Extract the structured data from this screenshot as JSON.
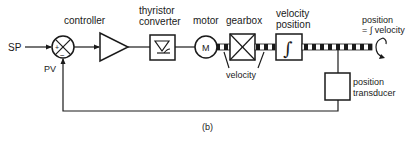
{
  "diagram": {
    "caption": "(b)",
    "input": {
      "label": "SP"
    },
    "feedback": {
      "label": "PV"
    },
    "summing_junction": {
      "plus": "+",
      "minus": "−"
    },
    "blocks": {
      "controller": {
        "label": "controller"
      },
      "thyristor": {
        "label_line1": "thyristor",
        "label_line2": "converter"
      },
      "motor": {
        "label": "motor",
        "symbol": "M"
      },
      "gearbox": {
        "label": "gearbox"
      },
      "integrator": {
        "label_line1": "velocity",
        "label_line2": "position",
        "symbol": "∫"
      },
      "transducer": {
        "label_line1": "position",
        "label_line2": "transducer"
      }
    },
    "annotations": {
      "shaft_velocity": "velocity",
      "output_line1": "position",
      "output_line2": "= ∫ velocity"
    },
    "colors": {
      "ink": "#1a1a1a",
      "background": "#ffffff"
    }
  }
}
